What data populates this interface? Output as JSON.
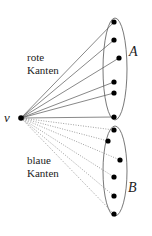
{
  "diagram": {
    "vertex_v": {
      "label": "v",
      "x": 21,
      "y": 118
    },
    "set_A": {
      "label": "A",
      "ellipse": {
        "cx": 115,
        "cy": 69,
        "rx": 12,
        "ry": 51
      },
      "label_pos": {
        "x": 129,
        "y": 56
      },
      "vertices": [
        {
          "x": 114,
          "y": 22
        },
        {
          "x": 114,
          "y": 40
        },
        {
          "x": 119,
          "y": 58
        },
        {
          "x": 114,
          "y": 82
        },
        {
          "x": 114,
          "y": 93
        },
        {
          "x": 114,
          "y": 117
        }
      ]
    },
    "set_B": {
      "label": "B",
      "ellipse": {
        "cx": 115,
        "cy": 171,
        "rx": 12,
        "ry": 45
      },
      "label_pos": {
        "x": 128,
        "y": 192
      },
      "vertices": [
        {
          "x": 114,
          "y": 130
        },
        {
          "x": 108,
          "y": 141
        },
        {
          "x": 120,
          "y": 160
        },
        {
          "x": 114,
          "y": 177
        },
        {
          "x": 114,
          "y": 196
        },
        {
          "x": 114,
          "y": 214
        }
      ]
    },
    "red_label": {
      "line1": "rote",
      "line2": "Kanten",
      "x": 27,
      "y1": 61,
      "y2": 74
    },
    "blue_label": {
      "line1": "blaue",
      "line2": "Kanten",
      "x": 27,
      "y1": 164,
      "y2": 177
    },
    "colors": {
      "stroke": "#555555",
      "vertex": "#000000",
      "dotted": "#777777"
    }
  }
}
